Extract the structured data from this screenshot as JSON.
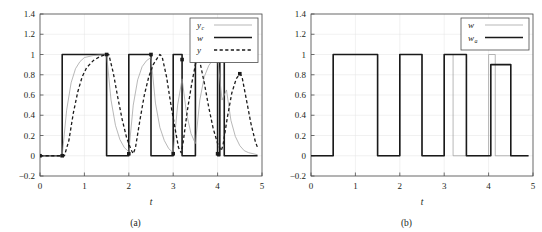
{
  "figure": {
    "panels": [
      {
        "id": "a",
        "subcaption": "(a)",
        "chart_data": {
          "type": "line",
          "title": "",
          "xlabel": "t",
          "ylabel": "",
          "xlim": [
            0,
            5
          ],
          "ylim": [
            -0.2,
            1.4
          ],
          "xticks": [
            "0",
            "1",
            "2",
            "3",
            "4",
            "5"
          ],
          "xtick_values": [
            0,
            1,
            2,
            3,
            4,
            5
          ],
          "yticks": [
            "-0.2",
            "0",
            "0.2",
            "0.4",
            "0.6",
            "0.8",
            "1",
            "1.2",
            "1.4"
          ],
          "ytick_values": [
            -0.2,
            0,
            0.2,
            0.4,
            0.6,
            0.8,
            1,
            1.2,
            1.4
          ],
          "grid": true,
          "legend_position": "top-right",
          "legend": [
            {
              "name": "y",
              "subscript": "c",
              "style": "thin-solid"
            },
            {
              "name": "w",
              "subscript": "",
              "style": "thick-solid"
            },
            {
              "name": "y",
              "subscript": "",
              "style": "dashed"
            }
          ],
          "series": [
            {
              "name": "w",
              "style": "thick-solid",
              "description": "reference square wave with shrinking pulse widths",
              "points": [
                [
                  0.0,
                  0.0
                ],
                [
                  0.5,
                  0.0
                ],
                [
                  0.5,
                  1.0
                ],
                [
                  1.5,
                  1.0
                ],
                [
                  1.5,
                  0.0
                ],
                [
                  2.0,
                  0.0
                ],
                [
                  2.0,
                  1.0
                ],
                [
                  2.5,
                  1.0
                ],
                [
                  2.5,
                  0.0
                ],
                [
                  3.0,
                  0.0
                ],
                [
                  3.0,
                  1.0
                ],
                [
                  3.2,
                  1.0
                ],
                [
                  3.2,
                  0.0
                ],
                [
                  3.5,
                  0.0
                ],
                [
                  3.5,
                  1.0
                ],
                [
                  4.0,
                  1.0
                ],
                [
                  4.0,
                  0.0
                ],
                [
                  4.05,
                  0.0
                ],
                [
                  4.05,
                  1.0
                ],
                [
                  4.15,
                  1.0
                ],
                [
                  4.15,
                  0.0
                ],
                [
                  4.9,
                  0.0
                ]
              ]
            },
            {
              "name": "y_c",
              "style": "thin-solid",
              "description": "fast first-order response tracking w",
              "points": [
                [
                  0.0,
                  0.0
                ],
                [
                  0.5,
                  0.0
                ],
                [
                  0.6,
                  0.45
                ],
                [
                  0.7,
                  0.72
                ],
                [
                  0.8,
                  0.86
                ],
                [
                  0.9,
                  0.93
                ],
                [
                  1.0,
                  0.97
                ],
                [
                  1.2,
                  0.99
                ],
                [
                  1.5,
                  1.0
                ],
                [
                  1.6,
                  0.55
                ],
                [
                  1.7,
                  0.3
                ],
                [
                  1.8,
                  0.16
                ],
                [
                  1.9,
                  0.08
                ],
                [
                  2.0,
                  0.04
                ],
                [
                  2.1,
                  0.5
                ],
                [
                  2.2,
                  0.75
                ],
                [
                  2.3,
                  0.88
                ],
                [
                  2.4,
                  0.94
                ],
                [
                  2.5,
                  0.97
                ],
                [
                  2.6,
                  0.52
                ],
                [
                  2.7,
                  0.28
                ],
                [
                  2.8,
                  0.15
                ],
                [
                  2.9,
                  0.07
                ],
                [
                  3.0,
                  0.03
                ],
                [
                  3.1,
                  0.5
                ],
                [
                  3.2,
                  0.76
                ],
                [
                  3.3,
                  0.42
                ],
                [
                  3.4,
                  0.22
                ],
                [
                  3.5,
                  0.12
                ],
                [
                  3.6,
                  0.55
                ],
                [
                  3.7,
                  0.78
                ],
                [
                  3.8,
                  0.89
                ],
                [
                  3.9,
                  0.95
                ],
                [
                  4.0,
                  0.97
                ],
                [
                  4.1,
                  0.55
                ],
                [
                  4.2,
                  0.65
                ],
                [
                  4.3,
                  0.35
                ],
                [
                  4.4,
                  0.19
                ],
                [
                  4.5,
                  0.1
                ],
                [
                  4.6,
                  0.05
                ],
                [
                  4.7,
                  0.03
                ],
                [
                  4.9,
                  0.01
                ]
              ]
            },
            {
              "name": "y",
              "style": "dashed",
              "description": "delayed plant output with slower rise and fall",
              "points": [
                [
                  0.0,
                  0.0
                ],
                [
                  0.55,
                  0.0
                ],
                [
                  0.65,
                  0.15
                ],
                [
                  0.75,
                  0.42
                ],
                [
                  0.85,
                  0.63
                ],
                [
                  0.95,
                  0.78
                ],
                [
                  1.05,
                  0.87
                ],
                [
                  1.2,
                  0.94
                ],
                [
                  1.35,
                  0.98
                ],
                [
                  1.5,
                  1.0
                ],
                [
                  1.55,
                  1.0
                ],
                [
                  1.65,
                  0.82
                ],
                [
                  1.75,
                  0.58
                ],
                [
                  1.85,
                  0.36
                ],
                [
                  1.95,
                  0.18
                ],
                [
                  2.05,
                  0.06
                ],
                [
                  2.1,
                  0.02
                ],
                [
                  2.15,
                  0.08
                ],
                [
                  2.25,
                  0.35
                ],
                [
                  2.35,
                  0.6
                ],
                [
                  2.45,
                  0.78
                ],
                [
                  2.55,
                  0.9
                ],
                [
                  2.65,
                  0.97
                ],
                [
                  2.7,
                  1.0
                ],
                [
                  2.75,
                  0.98
                ],
                [
                  2.85,
                  0.78
                ],
                [
                  2.95,
                  0.5
                ],
                [
                  3.05,
                  0.25
                ],
                [
                  3.12,
                  0.08
                ],
                [
                  3.18,
                  0.03
                ],
                [
                  3.22,
                  0.12
                ],
                [
                  3.32,
                  0.45
                ],
                [
                  3.42,
                  0.72
                ],
                [
                  3.5,
                  0.9
                ],
                [
                  3.55,
                  0.97
                ],
                [
                  3.6,
                  0.93
                ],
                [
                  3.7,
                  0.72
                ],
                [
                  3.8,
                  0.48
                ],
                [
                  3.9,
                  0.27
                ],
                [
                  4.0,
                  0.12
                ],
                [
                  4.08,
                  0.05
                ],
                [
                  4.12,
                  0.1
                ],
                [
                  4.22,
                  0.38
                ],
                [
                  4.32,
                  0.62
                ],
                [
                  4.42,
                  0.76
                ],
                [
                  4.5,
                  0.81
                ],
                [
                  4.55,
                  0.78
                ],
                [
                  4.65,
                  0.55
                ],
                [
                  4.75,
                  0.32
                ],
                [
                  4.85,
                  0.14
                ],
                [
                  4.9,
                  0.08
                ]
              ]
            }
          ],
          "markers": {
            "description": "square sampling markers on w at switching instants",
            "points": [
              [
                0.0,
                0.0
              ],
              [
                0.5,
                0.0
              ],
              [
                1.5,
                1.0
              ],
              [
                2.0,
                0.02
              ],
              [
                2.5,
                1.0
              ],
              [
                3.0,
                0.02
              ],
              [
                3.2,
                0.95
              ],
              [
                3.5,
                1.0
              ],
              [
                4.0,
                0.02
              ],
              [
                4.05,
                1.0
              ],
              [
                4.5,
                0.81
              ]
            ]
          }
        }
      },
      {
        "id": "b",
        "subcaption": "(b)",
        "chart_data": {
          "type": "line",
          "title": "",
          "xlabel": "t",
          "ylabel": "",
          "xlim": [
            0,
            5
          ],
          "ylim": [
            -0.2,
            1.4
          ],
          "xticks": [
            "0",
            "1",
            "2",
            "3",
            "4",
            "5"
          ],
          "xtick_values": [
            0,
            1,
            2,
            3,
            4,
            5
          ],
          "yticks": [
            "-0.2",
            "0",
            "0.2",
            "0.4",
            "0.6",
            "0.8",
            "1",
            "1.2",
            "1.4"
          ],
          "ytick_values": [
            -0.2,
            0,
            0.2,
            0.4,
            0.6,
            0.8,
            1,
            1.2,
            1.4
          ],
          "grid": true,
          "legend_position": "top-right",
          "legend": [
            {
              "name": "w",
              "subscript": "",
              "style": "thin-solid"
            },
            {
              "name": "w",
              "subscript": "a",
              "style": "thick-solid"
            }
          ],
          "series": [
            {
              "name": "w",
              "style": "thin-solid",
              "description": "original reference square wave",
              "points": [
                [
                  0.0,
                  0.0
                ],
                [
                  0.5,
                  0.0
                ],
                [
                  0.5,
                  1.0
                ],
                [
                  1.5,
                  1.0
                ],
                [
                  1.5,
                  0.0
                ],
                [
                  2.0,
                  0.0
                ],
                [
                  2.0,
                  1.0
                ],
                [
                  2.5,
                  1.0
                ],
                [
                  2.5,
                  0.0
                ],
                [
                  3.0,
                  0.0
                ],
                [
                  3.0,
                  1.0
                ],
                [
                  3.2,
                  1.0
                ],
                [
                  3.2,
                  0.0
                ],
                [
                  3.5,
                  0.0
                ],
                [
                  3.5,
                  0.0
                ],
                [
                  4.0,
                  0.0
                ],
                [
                  4.0,
                  1.0
                ],
                [
                  4.15,
                  1.0
                ],
                [
                  4.15,
                  0.0
                ],
                [
                  4.9,
                  0.0
                ]
              ]
            },
            {
              "name": "w_a",
              "style": "thick-solid",
              "description": "adapted reference: regularized pulses, last at 0.9",
              "points": [
                [
                  0.0,
                  0.0
                ],
                [
                  0.5,
                  0.0
                ],
                [
                  0.5,
                  1.0
                ],
                [
                  1.5,
                  1.0
                ],
                [
                  1.5,
                  0.0
                ],
                [
                  2.0,
                  0.0
                ],
                [
                  2.0,
                  1.0
                ],
                [
                  2.5,
                  1.0
                ],
                [
                  2.5,
                  0.0
                ],
                [
                  3.0,
                  0.0
                ],
                [
                  3.0,
                  1.0
                ],
                [
                  3.5,
                  1.0
                ],
                [
                  3.5,
                  0.0
                ],
                [
                  4.05,
                  0.0
                ],
                [
                  4.05,
                  0.9
                ],
                [
                  4.5,
                  0.9
                ],
                [
                  4.5,
                  0.0
                ],
                [
                  4.9,
                  0.0
                ]
              ]
            }
          ]
        }
      }
    ]
  }
}
